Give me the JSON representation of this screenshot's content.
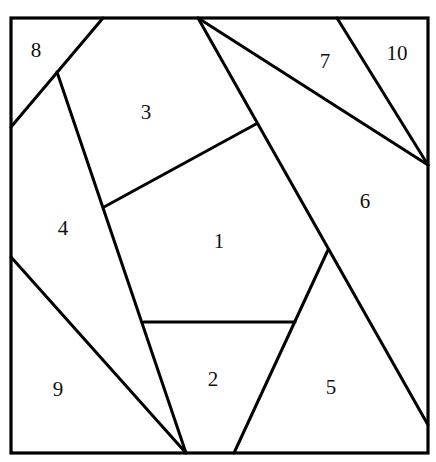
{
  "diagram": {
    "type": "crazy-quilt block piecing diagram",
    "colors": {
      "line": "#000000",
      "background": "#ffffff",
      "text": "#111111"
    },
    "border": {
      "x": 11,
      "y": 18,
      "width": 417,
      "height": 435
    },
    "vertices": {
      "A": [
        103,
        18
      ],
      "B": [
        198,
        18
      ],
      "C": [
        337,
        18
      ],
      "D": [
        11,
        127
      ],
      "E": [
        57,
        72
      ],
      "F": [
        11,
        257
      ],
      "G": [
        428,
        165
      ],
      "H": [
        428,
        425
      ],
      "I": [
        256,
        124
      ],
      "J": [
        104,
        207
      ],
      "K": [
        328,
        250
      ],
      "L": [
        144,
        322
      ],
      "M": [
        295,
        322
      ],
      "N": [
        186,
        453
      ],
      "O": [
        234,
        453
      ]
    },
    "edges": [
      {
        "id": "e8",
        "from": "A",
        "to": "D"
      },
      {
        "id": "e3a",
        "from": "E",
        "to": "N"
      },
      {
        "id": "e3b",
        "from": "J",
        "to": "I"
      },
      {
        "id": "e7",
        "from": "B",
        "to": "G"
      },
      {
        "id": "e10",
        "from": "C",
        "to": "G"
      },
      {
        "id": "e6",
        "from": "B",
        "to": "H"
      },
      {
        "id": "e5",
        "from": "K",
        "to": "O"
      },
      {
        "id": "e2",
        "from": "L",
        "to": "M"
      },
      {
        "id": "e9",
        "from": "F",
        "to": "N"
      }
    ],
    "pieces": [
      {
        "label": "1",
        "x": 219,
        "y": 243
      },
      {
        "label": "2",
        "x": 213,
        "y": 381
      },
      {
        "label": "3",
        "x": 146,
        "y": 114
      },
      {
        "label": "4",
        "x": 63,
        "y": 230
      },
      {
        "label": "5",
        "x": 331,
        "y": 389
      },
      {
        "label": "6",
        "x": 365,
        "y": 203
      },
      {
        "label": "7",
        "x": 325,
        "y": 63
      },
      {
        "label": "8",
        "x": 36,
        "y": 52
      },
      {
        "label": "9",
        "x": 58,
        "y": 391
      },
      {
        "label": "10",
        "x": 397,
        "y": 55
      }
    ]
  }
}
